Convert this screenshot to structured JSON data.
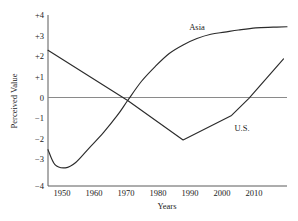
{
  "chart_data": {
    "type": "line",
    "title": "",
    "xlabel": "Years",
    "ylabel": "Perceived Value",
    "xlim": [
      1945,
      2014
    ],
    "ylim": [
      -4,
      4
    ],
    "grid": false,
    "legend_position": "inline-annotations",
    "zero_line": true,
    "x_ticks": [
      1950,
      1960,
      1970,
      1980,
      1990,
      2000,
      2010
    ],
    "x_tick_labels": [
      "1950",
      "1960",
      "1970",
      "1980",
      "1990",
      "2000",
      "2010"
    ],
    "y_ticks": [
      4,
      3,
      2,
      1,
      0,
      -1,
      -2,
      -3,
      -4
    ],
    "y_tick_labels": [
      "+4",
      "+3",
      "+2",
      "+1",
      "0",
      "−1",
      "−2",
      "−3",
      "−4"
    ],
    "series": [
      {
        "name": "Asia",
        "label": "Asia",
        "color": "#2b2b2b",
        "shape": "smooth-curve",
        "x": [
          1945,
          1947,
          1950,
          1953,
          1957,
          1961,
          1965,
          1968,
          1972,
          1976,
          1980,
          1984,
          1988,
          1992,
          1996,
          2000,
          2005,
          2010,
          2014
        ],
        "values": [
          -2.3,
          -3.0,
          -3.15,
          -2.9,
          -2.2,
          -1.5,
          -0.7,
          0.0,
          0.9,
          1.6,
          2.2,
          2.6,
          2.9,
          3.1,
          3.2,
          3.3,
          3.4,
          3.43,
          3.45
        ]
      },
      {
        "name": "U.S.",
        "label": "U.S.",
        "color": "#2b2b2b",
        "shape": "piecewise-linear",
        "x": [
          1945,
          1968,
          1984,
          1998,
          2003,
          2013
        ],
        "values": [
          2.35,
          0.0,
          -1.85,
          -0.7,
          0.1,
          1.95
        ]
      }
    ],
    "annotations": [
      {
        "text": "Asia",
        "x": 1987,
        "y": 3.75
      },
      {
        "text": "U.S.",
        "x": 2006,
        "y": -1.45
      }
    ]
  },
  "axes": {
    "y_axis_title": "Perceived Value",
    "x_axis_title": "Years"
  }
}
